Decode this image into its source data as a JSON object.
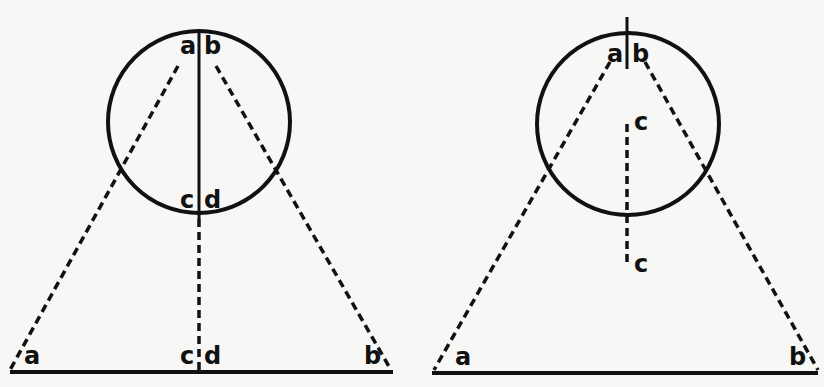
{
  "figures": {
    "left": {
      "labels": {
        "top_left": "a",
        "top_right": "b",
        "mid_left": "c",
        "mid_right": "d",
        "base_left": "a",
        "base_mid_left": "c",
        "base_mid_right": "d",
        "base_right": "b"
      }
    },
    "right": {
      "labels": {
        "top_left": "a",
        "top_right": "b",
        "center": "c",
        "lower": "c",
        "base_left": "a",
        "base_right": "b"
      }
    }
  },
  "colors": {
    "ink": "#111111",
    "paper": "#f7f7f5"
  }
}
